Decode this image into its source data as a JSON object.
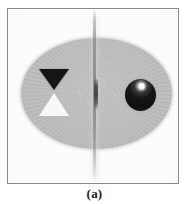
{
  "figure": {
    "caption": "(a)",
    "panel_label": "reconstructed-phantom-image",
    "alt_description": "Grayscale reconstructed elliptical phantom containing a dark downward triangle, a bright upward triangle, a dark sphere with a specular highlight, and a vertical streak artifact through the center."
  },
  "panel": {
    "background_color": "#fcfcfc",
    "border_color": "#8a8a8a",
    "width_px": 172,
    "height_px": 176
  },
  "objects": {
    "ellipse": {
      "name": "phantom-ellipse",
      "fill_color": "#bdbdbd",
      "edge_color": "#aeaeae",
      "center_x_px": 92,
      "center_y_px": 92,
      "semi_axis_x_px": 75,
      "semi_axis_y_px": 55
    },
    "dark_triangle": {
      "name": "dark-downward-triangle",
      "fill_color": "#121212",
      "orientation": "down",
      "center_x_px": 53,
      "top_y_px": 68,
      "width_px": 30,
      "height_px": 21
    },
    "light_triangle": {
      "name": "light-upward-triangle",
      "fill_color": "#fbfbfb",
      "orientation": "up",
      "center_x_px": 53,
      "top_y_px": 92,
      "width_px": 30,
      "height_px": 23
    },
    "sphere": {
      "name": "dark-sphere",
      "fill_color": "#0d0d0d",
      "highlight_color": "#ffffff",
      "center_x_px": 140,
      "center_y_px": 94,
      "radius_px": 16
    },
    "streak": {
      "name": "vertical-streak-artifact",
      "color": "#6e6e6e",
      "x_px": 92,
      "core_top_y_px": 78,
      "core_height_px": 30
    }
  },
  "colors": {
    "background": "#ffffff",
    "phantom_gray": "#bdbdbd",
    "dark_inclusion": "#121212",
    "light_inclusion": "#fbfbfb",
    "caption_text": "#1a1a1a"
  },
  "chart_data": {
    "type": "heatmap",
    "title": "(a)",
    "xlabel": "",
    "ylabel": "",
    "colormap": "grayscale",
    "value_range": [
      0,
      255
    ],
    "grid": false,
    "legend": "none",
    "annotations": [
      "dark downward triangle inclusion (left)",
      "bright upward triangle inclusion (left)",
      "dark sphere with specular highlight (right)",
      "vertical metal streak artifact (center)"
    ],
    "regions": [
      {
        "label": "background",
        "gray_value": 252,
        "shape": "rectangle"
      },
      {
        "label": "phantom ellipse",
        "gray_value": 189,
        "shape": "ellipse"
      },
      {
        "label": "dark triangle",
        "gray_value": 18,
        "shape": "triangle-down"
      },
      {
        "label": "light triangle",
        "gray_value": 251,
        "shape": "triangle-up"
      },
      {
        "label": "sphere body",
        "gray_value": 13,
        "shape": "circle"
      },
      {
        "label": "sphere highlight",
        "gray_value": 255,
        "shape": "circle"
      },
      {
        "label": "central streak artifact",
        "gray_value": 110,
        "shape": "line"
      }
    ]
  }
}
